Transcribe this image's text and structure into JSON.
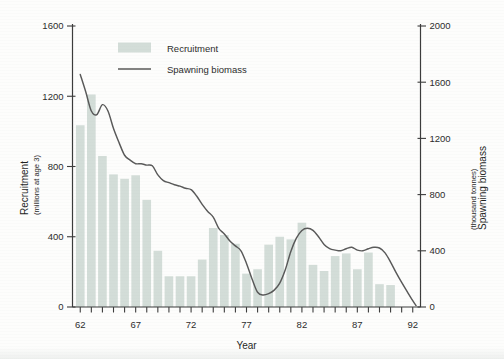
{
  "chart_data": {
    "type": "bar",
    "title": "",
    "xlabel": "Year",
    "ylabel": "Recruitment",
    "ylabel_units": "(millions at age 3)",
    "y2label": "Spawning biomass",
    "y2label_units": "(thousand tonnes)",
    "grid": false,
    "legend_position": "top-center",
    "xlim": [
      61.3,
      92.7
    ],
    "ylim": [
      0,
      1600
    ],
    "y2lim": [
      0,
      2000
    ],
    "ytick_labels": [
      "0",
      "400",
      "800",
      "1200",
      "1600"
    ],
    "ytick_values": [
      0,
      400,
      800,
      1200,
      1600
    ],
    "y2tick_labels": [
      "0",
      "400",
      "800",
      "1200",
      "1600",
      "2000"
    ],
    "y2tick_values": [
      0,
      400,
      800,
      1200,
      1600,
      2000
    ],
    "xtick_labels": [
      "62",
      "67",
      "72",
      "77",
      "82",
      "87",
      "92"
    ],
    "xtick_values": [
      62,
      67,
      72,
      77,
      82,
      87,
      92
    ],
    "xtick_minor_values": [
      62,
      63,
      64,
      65,
      66,
      67,
      68,
      69,
      70,
      71,
      72,
      73,
      74,
      75,
      76,
      77,
      78,
      79,
      80,
      81,
      82,
      83,
      84,
      85,
      86,
      87,
      88,
      89,
      90,
      91,
      92
    ],
    "categories": [
      62,
      63,
      64,
      65,
      66,
      67,
      68,
      69,
      70,
      71,
      72,
      73,
      74,
      75,
      76,
      77,
      78,
      79,
      80,
      81,
      82,
      83,
      84,
      85,
      86,
      87,
      88,
      89,
      90
    ],
    "series": [
      {
        "name": "Recruitment",
        "type": "bar",
        "axis": "left",
        "color": "#d3ddd8",
        "values": [
          1035,
          1210,
          860,
          755,
          730,
          750,
          610,
          320,
          175,
          175,
          175,
          270,
          450,
          410,
          360,
          190,
          215,
          355,
          400,
          385,
          480,
          240,
          205,
          290,
          305,
          215,
          310,
          130,
          125
        ]
      },
      {
        "name": "Spawning biomass",
        "type": "line",
        "axis": "right",
        "color": "#585858",
        "x": [
          62,
          62.5,
          63,
          63.5,
          64,
          64.5,
          65,
          65.5,
          66,
          66.5,
          67,
          67.5,
          68,
          68.5,
          69,
          69.5,
          70,
          70.5,
          71,
          71.5,
          72,
          72.5,
          73,
          73.5,
          74,
          74.5,
          75,
          75.5,
          76,
          76.5,
          77,
          77.5,
          78,
          78.5,
          79,
          79.5,
          80,
          80.5,
          81,
          81.5,
          82,
          82.5,
          83,
          83.5,
          84,
          84.5,
          85,
          85.5,
          86,
          86.5,
          87,
          87.5,
          88,
          88.5,
          89,
          89.5,
          90,
          90.5,
          91,
          91.5,
          92,
          92.3
        ],
        "values": [
          1655,
          1530,
          1395,
          1370,
          1440,
          1395,
          1270,
          1170,
          1080,
          1045,
          1020,
          1020,
          1010,
          1005,
          940,
          900,
          885,
          870,
          860,
          845,
          835,
          790,
          730,
          680,
          640,
          560,
          520,
          470,
          435,
          400,
          310,
          200,
          105,
          85,
          95,
          120,
          170,
          265,
          395,
          490,
          545,
          560,
          545,
          500,
          445,
          415,
          405,
          400,
          415,
          425,
          405,
          400,
          415,
          425,
          420,
          385,
          320,
          245,
          175,
          110,
          45,
          10
        ]
      }
    ]
  },
  "legend": {
    "items": [
      {
        "label": "Recruitment",
        "marker": "swatch",
        "color": "#d3ddd8"
      },
      {
        "label": "Spawning biomass",
        "marker": "line",
        "color": "#585858"
      }
    ]
  },
  "axes": {
    "left_title_main": "Recruitment",
    "left_title_sub": "(millions at age 3)",
    "right_title_main": "Spawning biomass",
    "right_title_sub": "(thousand tonnes)",
    "bottom_title": "Year"
  }
}
